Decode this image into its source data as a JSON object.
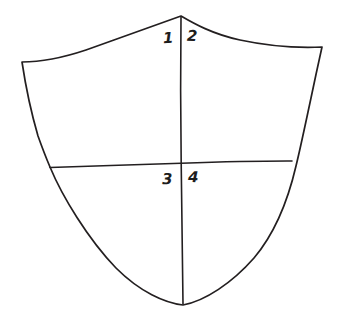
{
  "figure": {
    "background_color": "#ffffff",
    "ink_color": "#231f20",
    "faint_ink_color": "#d8d8d8",
    "stroke_width": 1.6,
    "style": "hand-drawn line art"
  },
  "shield": {
    "name": "heraldic-shield-outline",
    "apex": [
      181,
      16
    ],
    "top_left_corner": [
      22,
      62
    ],
    "top_right_corner": [
      322,
      47
    ],
    "bottom_point": [
      183,
      305
    ],
    "division": "quarterly",
    "divisions": {
      "vertical_line": {
        "name": "pale-division-line",
        "from": [
          181,
          16
        ],
        "to": [
          183,
          305
        ]
      },
      "horizontal_line": {
        "name": "fess-division-line",
        "from": [
          50,
          167
        ],
        "to": [
          292,
          161
        ]
      },
      "faint_guide_line": {
        "name": "faint-pencil-guide",
        "from": [
          152,
          30
        ],
        "to": [
          152,
          78
        ]
      }
    }
  },
  "labels": {
    "quadrants": [
      {
        "id": "q1",
        "text": "1",
        "position": [
          163,
          31
        ],
        "quadrant": "dexter-chief"
      },
      {
        "id": "q2",
        "text": "2",
        "position": [
          187,
          29
        ],
        "quadrant": "sinister-chief"
      },
      {
        "id": "q3",
        "text": "3",
        "position": [
          162,
          172
        ],
        "quadrant": "dexter-base"
      },
      {
        "id": "q4",
        "text": "4",
        "position": [
          188,
          170
        ],
        "quadrant": "sinister-base"
      }
    ]
  }
}
